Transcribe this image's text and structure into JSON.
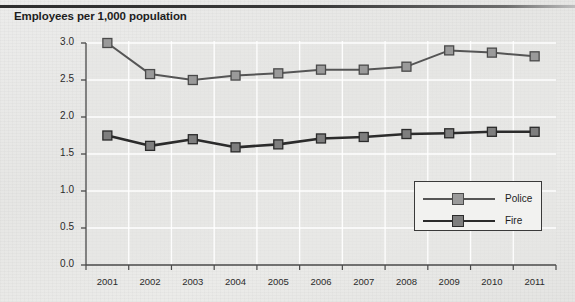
{
  "title": "Employees per 1,000 population",
  "legend": {
    "position": "bottom-right",
    "entries": [
      {
        "label": "Police",
        "color": "#555555",
        "marker_fill": "#9a9a9a",
        "marker_edge": "#4a4a4a"
      },
      {
        "label": "Fire",
        "color": "#2b2b2b",
        "marker_fill": "#7e7e7e",
        "marker_edge": "#2b2b2b"
      }
    ]
  },
  "colors": {
    "background": "#e8e8e6",
    "plot_background": "#e6e6e4",
    "gridline": "#ffffff",
    "axis": "#4a4a4a",
    "text": "#1d1d1d",
    "top_rule": "#2e2e2e"
  },
  "chart_data": {
    "type": "line",
    "title": "Employees per 1,000 population",
    "xlabel": "",
    "ylabel": "Employees per 1,000 population",
    "categories": [
      "2001",
      "2002",
      "2003",
      "2004",
      "2005",
      "2006",
      "2007",
      "2008",
      "2009",
      "2010",
      "2011"
    ],
    "x": [
      2001,
      2002,
      2003,
      2004,
      2005,
      2006,
      2007,
      2008,
      2009,
      2010,
      2011
    ],
    "ylim": [
      0.0,
      3.0
    ],
    "yticks": [
      "0.0",
      "0.5",
      "1.0",
      "1.5",
      "2.0",
      "2.5",
      "3.0"
    ],
    "ytick_values": [
      0.0,
      0.5,
      1.0,
      1.5,
      2.0,
      2.5,
      3.0
    ],
    "grid": true,
    "grid_axis": "both",
    "legend_position": "lower right",
    "marker": "square",
    "series": [
      {
        "name": "Police",
        "values": [
          3.0,
          2.58,
          2.5,
          2.56,
          2.59,
          2.64,
          2.64,
          2.68,
          2.9,
          2.87,
          2.82
        ],
        "color": "#555555",
        "linewidth": 2.0
      },
      {
        "name": "Fire",
        "values": [
          1.75,
          1.61,
          1.7,
          1.59,
          1.63,
          1.71,
          1.73,
          1.77,
          1.78,
          1.8,
          1.8
        ],
        "color": "#2b2b2b",
        "linewidth": 2.6
      }
    ]
  }
}
